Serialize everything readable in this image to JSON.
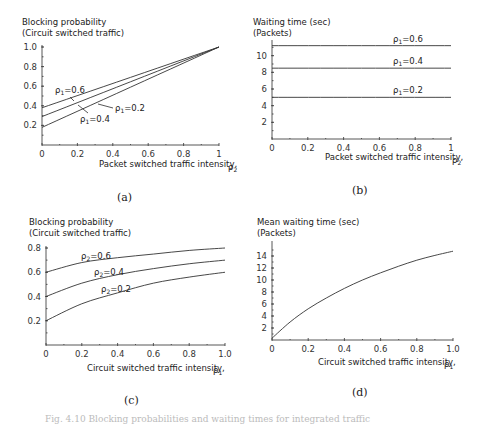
{
  "figure_caption": "Fig. 4.10 Blocking probabilities and waiting times for integrated traffic",
  "chart_data": [
    {
      "id": "a",
      "type": "line",
      "panel_label": "(a)",
      "ylabel_line1": "Blocking probability",
      "ylabel_line2": "(Circuit switched traffic)",
      "xlabel": "Packet switched traffic intensity,",
      "xlabel_symbol": "ρ2",
      "xlim": [
        0,
        1
      ],
      "ylim": [
        0,
        1.0
      ],
      "xticks": [
        "0",
        "0.2",
        "0.4",
        "0.6",
        "0.8",
        "1"
      ],
      "yticks": [
        "0.2",
        "0.4",
        "0.6",
        "0.8",
        "1.0"
      ],
      "grid": false,
      "x": [
        0,
        1
      ],
      "series": [
        {
          "name": "ρ1=0.6",
          "values": [
            0.38,
            1.0
          ]
        },
        {
          "name": "ρ1=0.4",
          "values": [
            0.29,
            1.0
          ]
        },
        {
          "name": "ρ1=0.2",
          "values": [
            0.18,
            1.0
          ]
        }
      ],
      "annotations": [
        "ρ1=0.6",
        "ρ1=0.4",
        "ρ1=0.2"
      ]
    },
    {
      "id": "b",
      "type": "line",
      "panel_label": "(b)",
      "ylabel_line1": "Waiting time (sec)",
      "ylabel_line2": "(Packets)",
      "xlabel": "Packet switched traffic intensity,",
      "xlabel_symbol": "ρ2",
      "xlim": [
        0,
        1
      ],
      "ylim": [
        0,
        12
      ],
      "xticks": [
        "0",
        "0.2",
        "0.4",
        "0.6",
        "0.8",
        "1"
      ],
      "yticks": [
        "2",
        "4",
        "6",
        "8",
        "10"
      ],
      "grid": false,
      "x": [
        0,
        1
      ],
      "series": [
        {
          "name": "ρ1=0.6",
          "values": [
            11.2,
            11.2
          ]
        },
        {
          "name": "ρ1=0.4",
          "values": [
            8.5,
            8.5
          ]
        },
        {
          "name": "ρ1=0.2",
          "values": [
            5.0,
            5.0
          ]
        }
      ],
      "annotations": [
        "ρ1=0.6",
        "ρ1=0.4",
        "ρ1=0.2"
      ]
    },
    {
      "id": "c",
      "type": "line",
      "panel_label": "(c)",
      "ylabel_line1": "Blocking probability",
      "ylabel_line2": "(Circuit switched traffic)",
      "xlabel": "Circuit switched traffic intensity,",
      "xlabel_symbol": "ρ1",
      "xlim": [
        0,
        1.0
      ],
      "ylim": [
        0,
        0.8
      ],
      "xticks": [
        "0",
        "0.2",
        "0.4",
        "0.6",
        "0.8",
        "1.0"
      ],
      "yticks": [
        "0.2",
        "0.4",
        "0.6",
        "0.8"
      ],
      "grid": false,
      "x": [
        0,
        0.2,
        0.4,
        0.6,
        0.8,
        1.0
      ],
      "series": [
        {
          "name": "ρ2=0.6",
          "values": [
            0.6,
            0.68,
            0.72,
            0.75,
            0.78,
            0.8
          ]
        },
        {
          "name": "ρ2=0.4",
          "values": [
            0.4,
            0.51,
            0.58,
            0.63,
            0.67,
            0.7
          ]
        },
        {
          "name": "ρ2=0.2",
          "values": [
            0.2,
            0.34,
            0.43,
            0.51,
            0.56,
            0.6
          ]
        }
      ],
      "annotations": [
        "ρ2=0.6",
        "ρ2=0.4",
        "ρ2=0.2"
      ]
    },
    {
      "id": "d",
      "type": "line",
      "panel_label": "(d)",
      "ylabel_line1": "Mean waiting time (sec)",
      "ylabel_line2": "(Packets)",
      "xlabel": "Circuit switched traffic intensity,",
      "xlabel_symbol": "ρ1",
      "xlim": [
        0,
        1.0
      ],
      "ylim": [
        0,
        16
      ],
      "xticks": [
        "0",
        "0.2",
        "0.4",
        "0.6",
        "0.8",
        "1.0"
      ],
      "yticks": [
        "2",
        "4",
        "6",
        "8",
        "10",
        "12",
        "14"
      ],
      "grid": false,
      "x": [
        0,
        0.1,
        0.2,
        0.3,
        0.4,
        0.5,
        0.6,
        0.7,
        0.8,
        0.9,
        1.0
      ],
      "series": [
        {
          "name": "Mean waiting time",
          "values": [
            0.3,
            3.0,
            5.2,
            7.0,
            8.6,
            10.0,
            11.2,
            12.3,
            13.3,
            14.1,
            14.8
          ]
        }
      ]
    }
  ]
}
